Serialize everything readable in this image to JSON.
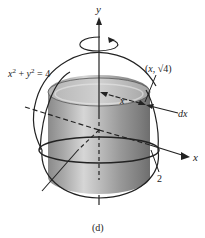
{
  "figure": {
    "caption": "(d)",
    "axes": {
      "y_label": "y",
      "x_label": "x"
    },
    "equation_label": "x² + y² = 4",
    "point_label": "(x, √4)",
    "radius_label": "x",
    "thickness_label": "dx",
    "tick_label": "2",
    "rotation_arrow": "rotation-about-y-axis",
    "colors": {
      "stroke": "#222222",
      "cylinder_dark": "#7a7a7a",
      "cylinder_light": "#c9c9c9",
      "background": "#ffffff"
    }
  }
}
